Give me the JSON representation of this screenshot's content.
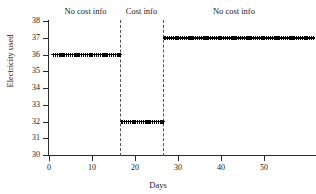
{
  "chart_data": {
    "type": "scatter",
    "title": "",
    "xlabel": "Days",
    "ylabel": "Electricity used",
    "xlim": [
      0,
      61
    ],
    "ylim": [
      30,
      38
    ],
    "xticks": [
      0,
      10,
      20,
      30,
      40,
      50
    ],
    "yticks": [
      30,
      31,
      32,
      33,
      34,
      35,
      36,
      37,
      38
    ],
    "grid": false,
    "legend": null,
    "marker": "plus",
    "marker_color": "#000000",
    "series": [
      {
        "name": "Electricity used",
        "x": [
          1,
          2,
          3,
          4,
          5,
          6,
          7,
          8,
          9,
          10,
          11,
          12,
          13,
          14,
          15,
          16,
          17,
          18,
          19,
          20,
          21,
          22,
          23,
          24,
          25,
          26,
          27,
          28,
          29,
          30,
          31,
          32,
          33,
          34,
          35,
          36,
          37,
          38,
          39,
          40,
          41,
          42,
          43,
          44,
          45,
          46,
          47,
          48,
          49,
          50,
          51,
          52,
          53,
          54,
          55,
          56,
          57,
          58,
          59,
          60,
          61
        ],
        "values": [
          36,
          36,
          36,
          36,
          36,
          36,
          36,
          36,
          36,
          36,
          36,
          36,
          36,
          36,
          36,
          36,
          32,
          32,
          32,
          32,
          32,
          32,
          32,
          32,
          32,
          32,
          37,
          37,
          37,
          37,
          37,
          37,
          37,
          37,
          37,
          37,
          37,
          37,
          37,
          37,
          37,
          37,
          37,
          37,
          37,
          37,
          37,
          37,
          37,
          37,
          37,
          37,
          37,
          37,
          37,
          37,
          37,
          37,
          37,
          37,
          37
        ]
      }
    ],
    "vlines": [
      {
        "x": 16.5,
        "style": "dashed",
        "color": "#555555"
      },
      {
        "x": 26.5,
        "style": "dashed",
        "color": "#555555"
      }
    ],
    "annotations": [
      {
        "text": "No cost info",
        "x": 8.5,
        "y": 38.4
      },
      {
        "text": "Cost info",
        "x": 21.5,
        "y": 38.4
      },
      {
        "text": "No cost info",
        "x": 43.0,
        "y": 38.4
      }
    ]
  }
}
